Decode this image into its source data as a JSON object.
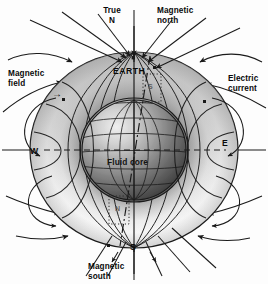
{
  "figure": {
    "background_color": "#fdfdfd",
    "ink_color": "#1a1a1a"
  },
  "labels": {
    "true_north": "True\nN",
    "magnetic_north": "Magnetic\nnorth",
    "magnetic_field": "Magnetic\nfield",
    "electric_current": "Electric\ncurrent",
    "earth": "EARTH",
    "fluid_core": "Fluid core",
    "magnetic_south": "Magnetic\nsouth",
    "west": "W",
    "east": "E",
    "pole_south_marker": "S",
    "dotted_pole_s": "S",
    "dotted_pole_n": "N"
  },
  "arrows": {
    "magnetic_field_pointer": "→"
  },
  "colors": {
    "torus_light": "#f4f4f4",
    "torus_mid": "#b4b4b4",
    "torus_dark": "#4a4a4a",
    "core_light": "#e8e8e8",
    "core_dark": "#3c3c3c",
    "line": "#1a1a1a"
  }
}
